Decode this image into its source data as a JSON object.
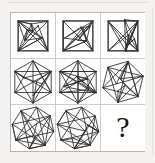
{
  "puzzle": {
    "type": "ravens-progressive-matrix",
    "title": "",
    "rows": 3,
    "columns": 3,
    "background_color": "#f4f3f1",
    "cell_background": "#ffffff",
    "grid_line_color": "#cfcdc9",
    "frame_color": "#b9b7b3",
    "stroke_color": "#2b2b2b",
    "missing_cell_label": "?",
    "cells": [
      {
        "id": "cell-r1c1",
        "row": 1,
        "column": 1,
        "shape": "square",
        "sides": 4,
        "rotation_deg": 0,
        "radius": 21,
        "chords": [
          [
            0,
            1
          ],
          [
            0,
            2
          ],
          [
            0,
            3
          ],
          [
            1,
            2
          ],
          [
            1,
            3
          ],
          [
            2,
            3
          ]
        ],
        "extra_points": 6,
        "description": "square with dense internal chord network"
      },
      {
        "id": "cell-r1c2",
        "row": 1,
        "column": 2,
        "shape": "square",
        "sides": 4,
        "rotation_deg": 0,
        "radius": 21,
        "chords": [
          [
            0,
            1
          ],
          [
            0,
            2
          ],
          [
            0,
            3
          ],
          [
            1,
            2
          ],
          [
            1,
            3
          ],
          [
            2,
            3
          ]
        ],
        "extra_points": 6,
        "description": "square with dense internal chord network"
      },
      {
        "id": "cell-r1c3",
        "row": 1,
        "column": 3,
        "shape": "square",
        "sides": 4,
        "rotation_deg": 0,
        "radius": 21,
        "chords": [
          [
            0,
            1
          ],
          [
            0,
            2
          ],
          [
            0,
            3
          ],
          [
            1,
            2
          ],
          [
            1,
            3
          ],
          [
            2,
            3
          ]
        ],
        "extra_points": 6,
        "description": "square with dense internal chord network"
      },
      {
        "id": "cell-r2c1",
        "row": 2,
        "column": 1,
        "shape": "hexagon",
        "sides": 6,
        "rotation_deg": 0,
        "radius": 21,
        "chords": [
          [
            0,
            2
          ],
          [
            0,
            3
          ],
          [
            0,
            4
          ],
          [
            1,
            3
          ],
          [
            1,
            4
          ],
          [
            1,
            5
          ],
          [
            2,
            4
          ],
          [
            2,
            5
          ],
          [
            3,
            5
          ]
        ],
        "extra_points": 4,
        "description": "hexagon with internal chord network"
      },
      {
        "id": "cell-r2c2",
        "row": 2,
        "column": 2,
        "shape": "hexagon",
        "sides": 6,
        "rotation_deg": 0,
        "radius": 21,
        "chords": [
          [
            0,
            2
          ],
          [
            0,
            3
          ],
          [
            0,
            4
          ],
          [
            1,
            3
          ],
          [
            1,
            4
          ],
          [
            1,
            5
          ],
          [
            2,
            4
          ],
          [
            2,
            5
          ],
          [
            3,
            5
          ]
        ],
        "extra_points": 4,
        "description": "hexagon with internal chord network"
      },
      {
        "id": "cell-r2c3",
        "row": 2,
        "column": 3,
        "shape": "hexagon",
        "sides": 6,
        "rotation_deg": 14,
        "radius": 21,
        "chords": [
          [
            0,
            2
          ],
          [
            0,
            3
          ],
          [
            0,
            4
          ],
          [
            1,
            3
          ],
          [
            1,
            4
          ],
          [
            1,
            5
          ],
          [
            2,
            4
          ],
          [
            2,
            5
          ],
          [
            3,
            5
          ]
        ],
        "extra_points": 4,
        "description": "rotated hexagon with internal chord network"
      },
      {
        "id": "cell-r3c1",
        "row": 3,
        "column": 1,
        "shape": "octagon",
        "sides": 8,
        "rotation_deg": 10,
        "radius": 21,
        "chords": [
          [
            0,
            2
          ],
          [
            0,
            3
          ],
          [
            0,
            5
          ],
          [
            1,
            4
          ],
          [
            1,
            6
          ],
          [
            2,
            5
          ],
          [
            2,
            7
          ],
          [
            3,
            6
          ],
          [
            4,
            7
          ],
          [
            3,
            5
          ],
          [
            1,
            3
          ]
        ],
        "extra_points": 3,
        "description": "octagon with internal chord network"
      },
      {
        "id": "cell-r3c2",
        "row": 3,
        "column": 2,
        "shape": "octagon",
        "sides": 8,
        "rotation_deg": 10,
        "radius": 21,
        "chords": [
          [
            0,
            2
          ],
          [
            0,
            3
          ],
          [
            0,
            5
          ],
          [
            1,
            4
          ],
          [
            1,
            6
          ],
          [
            2,
            5
          ],
          [
            2,
            7
          ],
          [
            3,
            6
          ],
          [
            4,
            7
          ],
          [
            3,
            5
          ],
          [
            1,
            3
          ]
        ],
        "extra_points": 3,
        "description": "octagon with internal chord network"
      },
      {
        "id": "cell-r3c3",
        "row": 3,
        "column": 3,
        "shape": "missing",
        "sides": 0,
        "rotation_deg": 0,
        "radius": 0,
        "chords": [],
        "extra_points": 0,
        "label": "?",
        "description": "missing tile marked with a question mark"
      }
    ]
  }
}
